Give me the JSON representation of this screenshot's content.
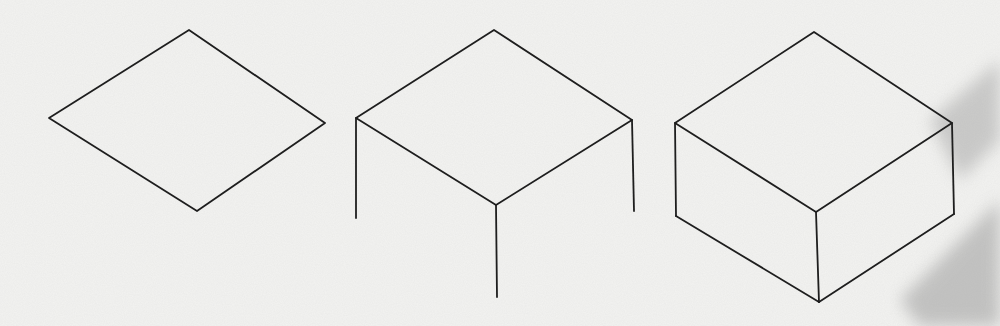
{
  "figure": {
    "paper_color": "#f3f3f1",
    "line_color": "#1e1e1e",
    "smudge_color": "#9a9a9a",
    "stages": [
      {
        "name": "top-face-rhombus",
        "points": {
          "top": [
            189,
            30
          ],
          "right": [
            325,
            123
          ],
          "bottom": [
            197,
            211
          ],
          "left": [
            49,
            118
          ]
        }
      },
      {
        "name": "top-face-with-vertical-edges",
        "points": {
          "top": [
            494,
            30
          ],
          "right": [
            632,
            120
          ],
          "front": [
            496,
            205
          ],
          "left": [
            356,
            118
          ]
        },
        "legs": [
          {
            "from": [
              356,
              118
            ],
            "to": [
              356,
              218
            ]
          },
          {
            "from": [
              632,
              120
            ],
            "to": [
              634,
              211
            ]
          },
          {
            "from": [
              496,
              205
            ],
            "to": [
              497,
              297
            ]
          }
        ]
      },
      {
        "name": "completed-box",
        "points": {
          "top": [
            814,
            32
          ],
          "right": [
            952,
            123
          ],
          "front": [
            816,
            212
          ],
          "left": [
            675,
            123
          ]
        },
        "bottom": {
          "left": [
            676,
            216
          ],
          "front": [
            819,
            302
          ],
          "right": [
            954,
            214
          ]
        }
      }
    ]
  }
}
